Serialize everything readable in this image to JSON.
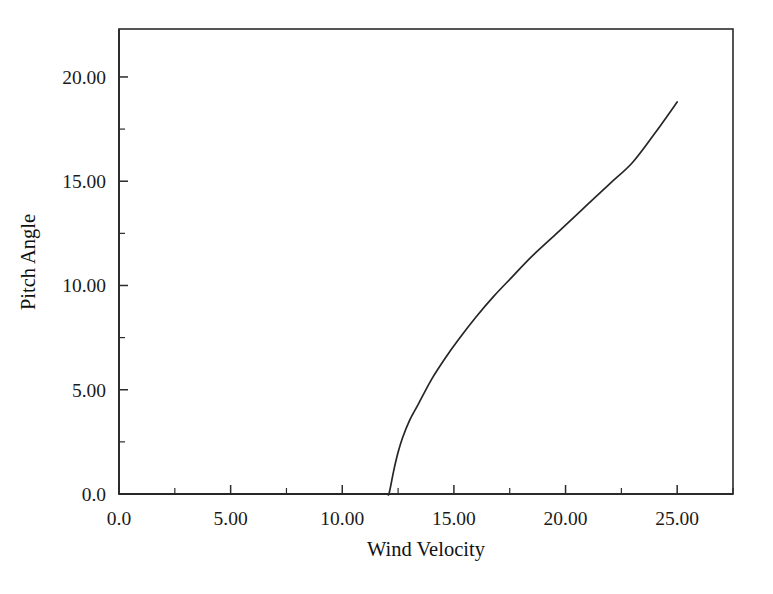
{
  "chart_data": {
    "type": "line",
    "title": "",
    "xlabel": "Wind Velocity",
    "ylabel": "Pitch Angle",
    "xlim": [
      0.0,
      27.5
    ],
    "ylim": [
      0.0,
      22.3
    ],
    "xticks": [
      0.0,
      5.0,
      10.0,
      15.0,
      20.0,
      25.0
    ],
    "xtick_labels": [
      "0.0",
      "5.00",
      "10.00",
      "15.00",
      "20.00",
      "25.00"
    ],
    "xminor_step": 2.5,
    "yticks": [
      0.0,
      5.0,
      10.0,
      15.0,
      20.0
    ],
    "ytick_labels": [
      "0.0",
      "5.00",
      "10.00",
      "15.00",
      "20.00"
    ],
    "yminor_step": 2.5,
    "grid": false,
    "legend": null,
    "frame": true,
    "series": [
      {
        "name": "Pitch Angle",
        "color": "#262626",
        "x": [
          0.0,
          2.0,
          4.0,
          6.0,
          8.0,
          10.0,
          11.0,
          11.6,
          12.0,
          12.1,
          12.3,
          12.5,
          12.7,
          13.0,
          13.4,
          14.0,
          14.6,
          15.2,
          16.0,
          16.8,
          17.6,
          18.4,
          19.2,
          20.0,
          21.0,
          22.0,
          23.0,
          24.0,
          25.0
        ],
        "y": [
          0.0,
          0.0,
          0.0,
          0.0,
          0.0,
          0.0,
          0.0,
          0.0,
          0.0,
          0.05,
          1.1,
          2.0,
          2.7,
          3.5,
          4.3,
          5.5,
          6.5,
          7.4,
          8.5,
          9.5,
          10.4,
          11.3,
          12.1,
          12.9,
          13.9,
          14.9,
          15.9,
          17.3,
          18.8
        ]
      }
    ]
  },
  "axis_labels": {
    "x_title": "Wind Velocity",
    "y_title": "Pitch Angle"
  }
}
